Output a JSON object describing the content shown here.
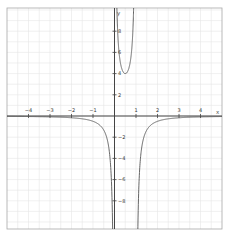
{
  "chart_data": {
    "type": "line",
    "title": "",
    "xlabel": "x",
    "ylabel": "y",
    "function": "y = 1/(x(1-x))",
    "xlim": [
      -5,
      5
    ],
    "ylim": [
      -10.7,
      10.2
    ],
    "grid": true,
    "legend": null,
    "x_ticks": [
      -4,
      -3,
      -2,
      -1,
      1,
      2,
      3,
      4
    ],
    "x_tick_labels": [
      "−4",
      "−3",
      "−2",
      "−1",
      "1",
      "2",
      "3",
      "4"
    ],
    "y_ticks": [
      8,
      6,
      4,
      2,
      -2,
      -4,
      -6,
      -8
    ],
    "y_tick_labels": [
      "8",
      "6",
      "4",
      "2",
      "−2",
      "−4",
      "−6",
      "−8"
    ],
    "vertical_asymptotes": [
      0,
      1
    ],
    "horizontal_asymptote": 0,
    "local_minimum": {
      "x": 0.5,
      "y": 4
    },
    "series": [
      {
        "name": "left branch",
        "x": [
          -5,
          -4,
          -3,
          -2,
          -1,
          -0.5,
          -0.2,
          -0.1
        ],
        "values": [
          -0.033,
          -0.05,
          -0.083,
          -0.167,
          -0.5,
          -1.333,
          -4.167,
          -9.09
        ]
      },
      {
        "name": "middle branch",
        "x": [
          0.1,
          0.2,
          0.3,
          0.5,
          0.7,
          0.8,
          0.9
        ],
        "values": [
          11.1,
          6.25,
          4.76,
          4,
          4.76,
          6.25,
          11.1
        ]
      },
      {
        "name": "right branch",
        "x": [
          1.1,
          1.2,
          1.5,
          2,
          3,
          4,
          5
        ],
        "values": [
          -9.09,
          -4.167,
          -1.333,
          -0.5,
          -0.167,
          -0.083,
          -0.05
        ]
      }
    ],
    "colors": {
      "curve": "#555555",
      "axis": "#444444",
      "grid": "#e6e6e6",
      "frame": "#999999"
    }
  }
}
